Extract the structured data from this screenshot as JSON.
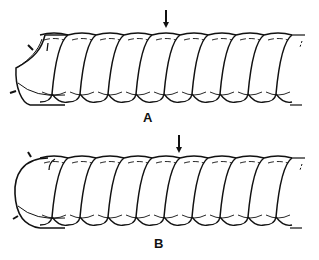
{
  "figure": {
    "panels": [
      {
        "id": "A",
        "label": "A",
        "end_type": "cut-oblique",
        "coils_visible": 9,
        "arrow": "marker above coil"
      },
      {
        "id": "B",
        "label": "B",
        "end_type": "rounded",
        "coils_visible": 9,
        "arrow": "marker above coil"
      }
    ],
    "colors": {
      "stroke": "#111111",
      "background": "#ffffff"
    }
  }
}
